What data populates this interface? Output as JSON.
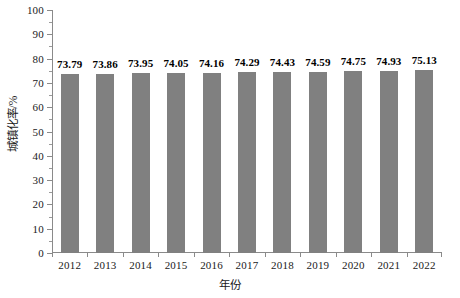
{
  "chart_data": {
    "type": "bar",
    "title": "",
    "subtitle": "",
    "xlabel": "年份",
    "ylabel": "城镇化率/%",
    "categories": [
      "2012",
      "2013",
      "2014",
      "2015",
      "2016",
      "2017",
      "2018",
      "2019",
      "2020",
      "2021",
      "2022"
    ],
    "values": [
      73.79,
      73.86,
      73.95,
      74.05,
      74.16,
      74.29,
      74.43,
      74.59,
      74.75,
      74.93,
      75.13
    ],
    "data_labels": [
      "73.79",
      "73.86",
      "73.95",
      "74.05",
      "74.16",
      "74.29",
      "74.43",
      "74.59",
      "74.75",
      "74.93",
      "75.13"
    ],
    "ylim": [
      0,
      100
    ],
    "ytick_values": [
      0,
      10,
      20,
      30,
      40,
      50,
      60,
      70,
      80,
      90,
      100
    ],
    "ytick_labels": [
      "0",
      "10",
      "20",
      "30",
      "40",
      "50",
      "60",
      "70",
      "80",
      "90",
      "100"
    ],
    "yminor_tick_interval": 5,
    "grid": false,
    "legend": false,
    "legend_position": "none",
    "bar_color": "#808080",
    "axis_color": "#8a8a8a",
    "text_color": "#1a1a1a",
    "background_color": "#ffffff"
  }
}
